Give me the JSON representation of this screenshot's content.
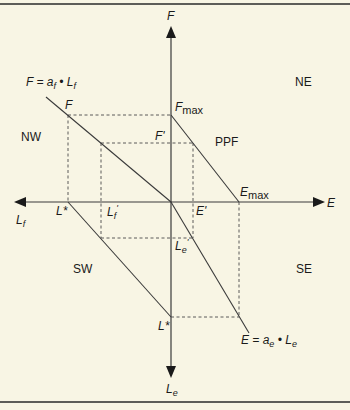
{
  "diagram": {
    "axes": {
      "up": "F",
      "right": "E",
      "left": "L",
      "left_sub": "f",
      "down": "L",
      "down_sub": "e"
    },
    "quadrants": {
      "nw": "NW",
      "ne": "NE",
      "sw": "SW",
      "se": "SE"
    },
    "curves": {
      "ppf": "PPF",
      "nw_eq_lhs": "F = a",
      "nw_eq_a_sub": "f",
      "nw_eq_mid": " • L",
      "nw_eq_l_sub": "f",
      "se_eq_lhs": "E = a",
      "se_eq_a_sub": "e",
      "se_eq_mid": " • L",
      "se_eq_l_sub": "e"
    },
    "points": {
      "f_point": "F",
      "f_max": "F",
      "f_max_sub": "max",
      "f_prime": "F'",
      "e_max": "E",
      "e_max_sub": "max",
      "e_prime": "E'",
      "l_star_left": "L*",
      "l_star_bottom": "L*",
      "lf_prime": "L",
      "lf_prime_sub": "f",
      "lf_prime_mark": "'",
      "le_prime": "L",
      "le_prime_sub": "e",
      "le_prime_mark": "'"
    }
  }
}
